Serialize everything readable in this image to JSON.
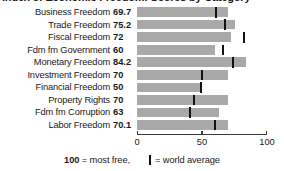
{
  "title": {
    "text": "Index of Economic Freedom: Scores by Category",
    "cut_off": true
  },
  "legend": {
    "most_free_number": "100",
    "most_free_text": " = most free,",
    "world_average_text": "= world average",
    "world_average_swatch": "world-average-tick-icon"
  },
  "colors": {
    "bar": "#a9a9a9",
    "tick": "#111111",
    "axis": "#3a3a3a",
    "text": "#1a1a1a",
    "background": "#ffffff"
  },
  "chart_data": {
    "type": "bar",
    "orientation": "horizontal",
    "title": "Index of Economic Freedom: Scores by Category",
    "xlabel": "",
    "ylabel": "",
    "xlim": [
      0,
      100
    ],
    "grid": false,
    "legend_position": "bottom",
    "xticks": [
      "0",
      "50",
      "100"
    ],
    "xtick_values": [
      0,
      50,
      100
    ],
    "categories": [
      "Business Freedom",
      "Trade Freedom",
      "Fiscal Freedom",
      "Fdm fm Government",
      "Monetary Freedom",
      "Investment Freedom",
      "Financial Freedom",
      "Property Rights",
      "Fdm fm Corruption",
      "Labor Freedom"
    ],
    "values": [
      69.7,
      75.2,
      72,
      60,
      84.2,
      70,
      50,
      70,
      63,
      70.1
    ],
    "value_labels": [
      "69.7",
      "75.2",
      "72",
      "60",
      "84.2",
      "70",
      "50",
      "70",
      "63",
      "70.1"
    ],
    "series": [
      {
        "name": "Country score",
        "values": [
          69.7,
          75.2,
          72,
          60,
          84.2,
          70,
          50,
          70,
          63,
          70.1
        ]
      },
      {
        "name": "World average",
        "marker": "vertical-tick",
        "values": [
          61,
          68,
          82,
          66,
          74,
          50,
          49,
          44,
          41,
          60
        ]
      }
    ],
    "rows": [
      {
        "label": "Business Freedom",
        "value_label": "69.7",
        "value": 69.7,
        "world_average": 61
      },
      {
        "label": "Trade Freedom",
        "value_label": "75.2",
        "value": 75.2,
        "world_average": 68
      },
      {
        "label": "Fiscal Freedom",
        "value_label": "72",
        "value": 72,
        "world_average": 82
      },
      {
        "label": "Fdm fm Government",
        "value_label": "60",
        "value": 60,
        "world_average": 66
      },
      {
        "label": "Monetary Freedom",
        "value_label": "84.2",
        "value": 84.2,
        "world_average": 74
      },
      {
        "label": "Investment Freedom",
        "value_label": "70",
        "value": 70,
        "world_average": 50
      },
      {
        "label": "Financial Freedom",
        "value_label": "50",
        "value": 50,
        "world_average": 49
      },
      {
        "label": "Property Rights",
        "value_label": "70",
        "value": 70,
        "world_average": 44
      },
      {
        "label": "Fdm fm Corruption",
        "value_label": "63",
        "value": 63,
        "world_average": 41
      },
      {
        "label": "Labor Freedom",
        "value_label": "70.1",
        "value": 70.1,
        "world_average": 60
      }
    ]
  }
}
